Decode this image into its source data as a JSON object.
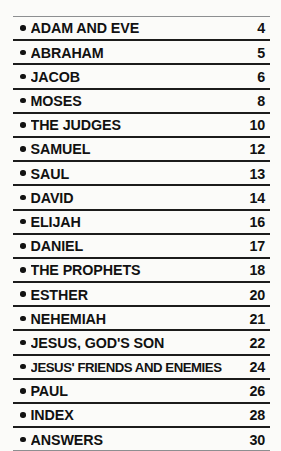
{
  "document": {
    "kind": "table-of-contents",
    "bullet_icon": "bullet-dot-icon",
    "colors": {
      "background": "#fbfbf9",
      "text": "#111111",
      "rule_strong": "#1c1c1c",
      "rule_light": "#8d8f91"
    },
    "entries": [
      {
        "title": "ADAM AND EVE",
        "page": "4"
      },
      {
        "title": "ABRAHAM",
        "page": "5"
      },
      {
        "title": "JACOB",
        "page": "6"
      },
      {
        "title": "MOSES",
        "page": "8"
      },
      {
        "title": "THE JUDGES",
        "page": "10"
      },
      {
        "title": "SAMUEL",
        "page": "12"
      },
      {
        "title": "SAUL",
        "page": "13"
      },
      {
        "title": "DAVID",
        "page": "14"
      },
      {
        "title": "ELIJAH",
        "page": "16"
      },
      {
        "title": "DANIEL",
        "page": "17"
      },
      {
        "title": "THE PROPHETS",
        "page": "18"
      },
      {
        "title": "ESTHER",
        "page": "20"
      },
      {
        "title": "NEHEMIAH",
        "page": "21"
      },
      {
        "title": "JESUS, GOD'S SON",
        "page": "22"
      },
      {
        "title": "JESUS' FRIENDS AND ENEMIES",
        "page": "24"
      },
      {
        "title": "PAUL",
        "page": "26"
      },
      {
        "title": "INDEX",
        "page": "28"
      },
      {
        "title": "ANSWERS",
        "page": "30"
      }
    ]
  }
}
